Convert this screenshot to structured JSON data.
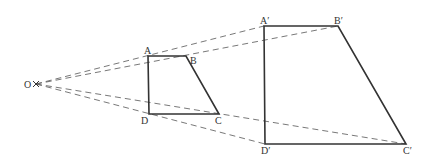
{
  "diagram": {
    "center": {
      "label": "O",
      "x": 36,
      "y": 84
    },
    "original": {
      "A": {
        "label": "A",
        "x": 148,
        "y": 56
      },
      "B": {
        "label": "B",
        "x": 186,
        "y": 56
      },
      "C": {
        "label": "C",
        "x": 219,
        "y": 114
      },
      "D": {
        "label": "D",
        "x": 149,
        "y": 114
      }
    },
    "image": {
      "A": {
        "label": "A′",
        "x": 264,
        "y": 26
      },
      "B": {
        "label": "B′",
        "x": 338,
        "y": 26
      },
      "C": {
        "label": "C′",
        "x": 406,
        "y": 144
      },
      "D": {
        "label": "D′",
        "x": 265,
        "y": 144
      }
    },
    "colors": {
      "stroke": "#333333",
      "dashed": "#555555"
    }
  }
}
